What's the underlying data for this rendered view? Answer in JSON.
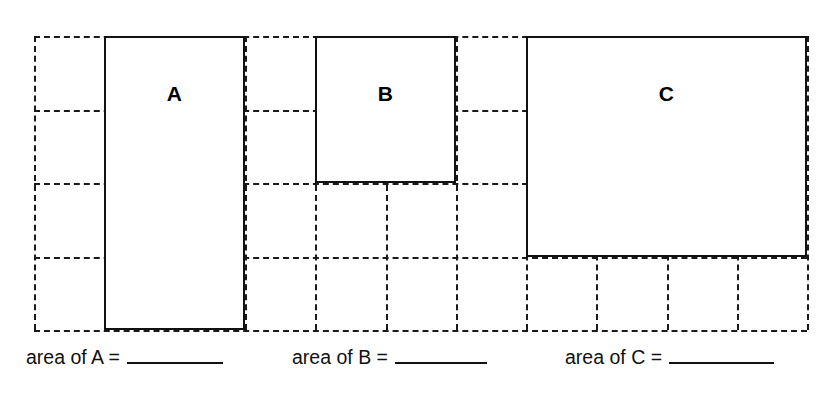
{
  "worksheet": {
    "title": "area of rectangles on a grid",
    "background_color": "#ffffff",
    "line_color": "#111111",
    "grid_line_color": "#1a1a1a"
  },
  "grid": {
    "columns": 11,
    "rows": 4,
    "origin_x": 34,
    "origin_y": 36,
    "cell_width": 70.3,
    "cell_height": 73.5,
    "style": "dashed",
    "x_positions": [
      34,
      104.3,
      174.6,
      244.9,
      315.2,
      385.5,
      455.8,
      526.1,
      596.4,
      666.7,
      737,
      807.3
    ],
    "y_positions": [
      36,
      109.5,
      183,
      256.5,
      330
    ]
  },
  "rectangles": [
    {
      "id": "A",
      "label": "A",
      "col_start": 1,
      "col_span": 2,
      "row_start": 0,
      "row_span": 4,
      "left": 104.3,
      "top": 36,
      "width": 140.6,
      "height": 294,
      "label_top": 80,
      "area_units": 8
    },
    {
      "id": "B",
      "label": "B",
      "col_start": 4,
      "col_span": 2,
      "row_start": 0,
      "row_span": 2,
      "left": 315.2,
      "top": 36,
      "width": 140.6,
      "height": 147,
      "label_top": 80,
      "area_units": 4
    },
    {
      "id": "C",
      "label": "C",
      "col_start": 7,
      "col_span": 4,
      "row_start": 0,
      "row_span": 3,
      "left": 526.1,
      "top": 36,
      "width": 281.2,
      "height": 220.5,
      "label_top": 80,
      "area_units": 12
    }
  ],
  "answers": [
    {
      "id": "A",
      "label": "area of A =",
      "value": "",
      "left": 26,
      "blank_width": 96
    },
    {
      "id": "B",
      "label": "area of B =",
      "value": "",
      "left": 292,
      "blank_width": 92
    },
    {
      "id": "C",
      "label": "area of C =",
      "value": "",
      "left": 565,
      "blank_width": 105
    }
  ]
}
